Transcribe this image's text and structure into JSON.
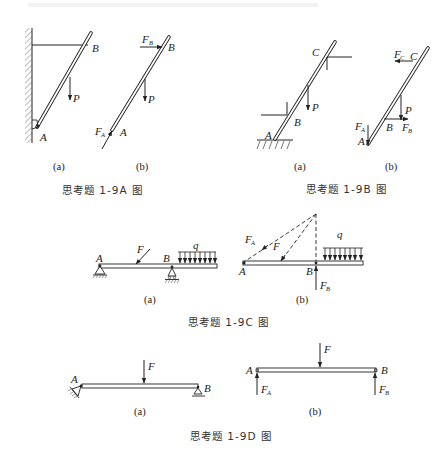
{
  "figures": {
    "fig_1_9A": {
      "title": "思考题 1-9A 图",
      "sub_a": {
        "caption": "(a)",
        "labels": {
          "A": "A",
          "B": "B",
          "P": "P"
        }
      },
      "sub_b": {
        "caption": "(b)",
        "labels": {
          "A": "A",
          "B": "B",
          "P": "P",
          "FA": "F",
          "FA_sub": "A",
          "FB": "F",
          "FB_sub": "B"
        }
      }
    },
    "fig_1_9B": {
      "title": "思考题 1-9B 图",
      "sub_a": {
        "caption": "(a)",
        "labels": {
          "A": "A",
          "B": "B",
          "C": "C",
          "P": "P"
        }
      },
      "sub_b": {
        "caption": "(b)",
        "labels": {
          "A": "A",
          "B": "B",
          "C": "C",
          "P": "P",
          "FA": "F",
          "FA_sub": "A",
          "FB": "F",
          "FB_sub": "B",
          "FC": "F",
          "FC_sub": "C"
        }
      }
    },
    "fig_1_9C": {
      "title": "思考题 1-9C 图",
      "sub_a": {
        "caption": "(a)",
        "labels": {
          "A": "A",
          "B": "B",
          "F": "F",
          "q": "q"
        }
      },
      "sub_b": {
        "caption": "(b)",
        "labels": {
          "A": "A",
          "B": "B",
          "F": "F",
          "q": "q",
          "FA": "F",
          "FA_sub": "A",
          "FB": "F",
          "FB_sub": "B"
        }
      }
    },
    "fig_1_9D": {
      "title": "思考题 1-9D 图",
      "sub_a": {
        "caption": "(a)",
        "labels": {
          "A": "A",
          "B": "B",
          "F": "F"
        }
      },
      "sub_b": {
        "caption": "(b)",
        "labels": {
          "A": "A",
          "B": "B",
          "F": "F",
          "FA": "F",
          "FA_sub": "A",
          "FB": "F",
          "FB_sub": "B"
        }
      }
    }
  }
}
